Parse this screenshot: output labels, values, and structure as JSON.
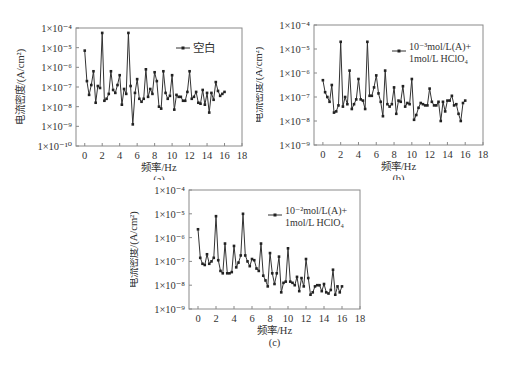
{
  "chart_data": [
    {
      "id": "a",
      "type": "line",
      "caption": "(a)",
      "xlabel": "频率/Hz",
      "ylabel": "电流密度/(A/cm²)",
      "yscale": "log",
      "ylim_exp": [
        -10,
        -4
      ],
      "xlim": [
        -1,
        18
      ],
      "xticks": [
        0,
        2,
        4,
        6,
        8,
        10,
        12,
        14,
        16,
        18
      ],
      "yticks": [
        "1×10⁻¹⁰",
        "1×10⁻⁹",
        "1×10⁻⁸",
        "1×10⁻⁷",
        "1×10⁻⁶",
        "1×10⁻⁵",
        "1×10⁻⁴"
      ],
      "legend": [
        "空白"
      ],
      "legend_position": "upper right",
      "grid": false,
      "series": [
        {
          "name": "空白",
          "x": [
            0,
            0.25,
            0.5,
            0.75,
            1,
            1.25,
            1.5,
            1.75,
            2,
            2.25,
            2.5,
            2.75,
            3,
            3.25,
            3.5,
            3.75,
            4,
            4.25,
            4.5,
            4.75,
            5,
            5.25,
            5.5,
            5.75,
            6,
            6.25,
            6.5,
            6.75,
            7,
            7.25,
            7.5,
            7.75,
            8,
            8.25,
            8.5,
            8.75,
            9,
            9.25,
            9.5,
            9.75,
            10,
            10.25,
            10.5,
            10.75,
            11,
            11.25,
            11.5,
            11.75,
            12,
            12.25,
            12.5,
            12.75,
            13,
            13.25,
            13.5,
            13.75,
            14,
            14.25,
            14.5,
            14.75,
            15,
            15.25,
            15.5,
            15.75,
            16
          ],
          "log10_y": [
            -5.15,
            -6.7,
            -7.4,
            -6.9,
            -6.2,
            -7.8,
            -6.95,
            -7.05,
            -4.25,
            -7.7,
            -7.6,
            -7.35,
            -6.2,
            -7.15,
            -7.3,
            -6.9,
            -6.4,
            -7.9,
            -7.1,
            -7.35,
            -4.25,
            -6.95,
            -8.9,
            -7.3,
            -6.6,
            -7.6,
            -7.75,
            -7.6,
            -6.1,
            -7.5,
            -7.1,
            -7.35,
            -6.25,
            -6.7,
            -8.0,
            -8.1,
            -6.2,
            -7.3,
            -7.6,
            -7.45,
            -6.4,
            -8.15,
            -7.4,
            -7.5,
            -7.5,
            -7.7,
            -7.7,
            -7.25,
            -6.2,
            -7.6,
            -7.5,
            -7.25,
            -7.8,
            -7.85,
            -7.15,
            -7.9,
            -7.3,
            -8.3,
            -7.3,
            -7.65,
            -6.75,
            -7.2,
            -7.45,
            -7.35,
            -7.25
          ]
        }
      ]
    },
    {
      "id": "b",
      "type": "line",
      "caption": "(b)",
      "xlabel": "频率/Hz",
      "ylabel": "电流密度/(A/cm²)",
      "yscale": "log",
      "ylim_exp": [
        -9,
        -4
      ],
      "xlim": [
        -1,
        18
      ],
      "xticks": [
        0,
        2,
        4,
        6,
        8,
        10,
        12,
        14,
        16,
        18
      ],
      "yticks": [
        "1×10⁻⁹",
        "1×10⁻⁸",
        "1×10⁻⁷",
        "1×10⁻⁶",
        "1×10⁻⁵",
        "1×10⁻⁴"
      ],
      "legend": [
        "10⁻³mol/L(A)+",
        "1mol/L HClO₄"
      ],
      "legend_position": "upper right",
      "grid": false,
      "series": [
        {
          "name": "10⁻³mol/L(A)+1mol/L HClO₄",
          "x": [
            0,
            0.25,
            0.5,
            0.75,
            1,
            1.25,
            1.5,
            1.75,
            2,
            2.25,
            2.5,
            2.75,
            3,
            3.25,
            3.5,
            3.75,
            4,
            4.25,
            4.5,
            4.75,
            5,
            5.25,
            5.5,
            5.75,
            6,
            6.25,
            6.5,
            6.75,
            7,
            7.25,
            7.5,
            7.75,
            8,
            8.25,
            8.5,
            8.75,
            9,
            9.25,
            9.5,
            9.75,
            10,
            10.25,
            10.5,
            10.75,
            11,
            11.25,
            11.5,
            11.75,
            12,
            12.25,
            12.5,
            12.75,
            13,
            13.25,
            13.5,
            13.75,
            14,
            14.25,
            14.5,
            14.75,
            15,
            15.25,
            15.5,
            15.75,
            16
          ],
          "log10_y": [
            -6.3,
            -6.8,
            -7.0,
            -7.2,
            -6.5,
            -7.65,
            -7.6,
            -7.35,
            -4.7,
            -7.4,
            -7.0,
            -7.3,
            -5.9,
            -7.5,
            -7.3,
            -7.1,
            -6.25,
            -7.1,
            -7.15,
            -7.5,
            -4.7,
            -6.95,
            -6.95,
            -6.6,
            -6.1,
            -6.85,
            -7.2,
            -7.8,
            -5.9,
            -7.3,
            -7.4,
            -7.3,
            -6.6,
            -7.7,
            -7.15,
            -7.2,
            -6.55,
            -7.4,
            -7.25,
            -7.3,
            -6.25,
            -7.95,
            -7.75,
            -7.45,
            -7.25,
            -7.3,
            -7.35,
            -7.35,
            -6.65,
            -7.2,
            -7.35,
            -7.35,
            -7.2,
            -8.0,
            -7.2,
            -7.6,
            -7.15,
            -7.15,
            -6.95,
            -7.35,
            -7.3,
            -7.7,
            -8.0,
            -7.25,
            -7.15
          ]
        }
      ]
    },
    {
      "id": "c",
      "type": "line",
      "caption": "(c)",
      "xlabel": "频率/Hz",
      "ylabel": "电流密度/(A/cm²)",
      "yscale": "log",
      "ylim_exp": [
        -9,
        -4
      ],
      "xlim": [
        -1,
        18
      ],
      "xticks": [
        0,
        2,
        4,
        6,
        8,
        10,
        12,
        14,
        16,
        18
      ],
      "yticks": [
        "1×10⁻⁹",
        "1×10⁻⁸",
        "1×10⁻⁷",
        "1×10⁻⁶",
        "1×10⁻⁵",
        "1×10⁻⁴"
      ],
      "legend": [
        "10⁻²mol/L(A)+",
        "1mol/L HClO₄"
      ],
      "legend_position": "upper right",
      "grid": false,
      "series": [
        {
          "name": "10⁻²mol/L(A)+1mol/L HClO₄",
          "x": [
            0,
            0.25,
            0.5,
            0.75,
            1,
            1.25,
            1.5,
            1.75,
            2,
            2.25,
            2.5,
            2.75,
            3,
            3.25,
            3.5,
            3.75,
            4,
            4.25,
            4.5,
            4.75,
            5,
            5.25,
            5.5,
            5.75,
            6,
            6.25,
            6.5,
            6.75,
            7,
            7.25,
            7.5,
            7.75,
            8,
            8.25,
            8.5,
            8.75,
            9,
            9.25,
            9.5,
            9.75,
            10,
            10.25,
            10.5,
            10.75,
            11,
            11.25,
            11.5,
            11.75,
            12,
            12.25,
            12.5,
            12.75,
            13,
            13.25,
            13.5,
            13.75,
            14,
            14.25,
            14.5,
            14.75,
            15,
            15.25,
            15.5,
            15.75,
            16
          ],
          "log10_y": [
            -5.65,
            -6.85,
            -7.1,
            -7.15,
            -6.7,
            -7.1,
            -7.0,
            -6.85,
            -5.1,
            -6.95,
            -7.4,
            -7.5,
            -6.25,
            -7.5,
            -7.5,
            -7.45,
            -6.35,
            -7.25,
            -7.05,
            -6.75,
            -5.0,
            -6.75,
            -7.0,
            -7.2,
            -6.9,
            -6.95,
            -7.3,
            -7.4,
            -6.25,
            -7.6,
            -7.8,
            -8.05,
            -6.65,
            -7.5,
            -7.95,
            -7.5,
            -6.8,
            -8.3,
            -7.9,
            -7.85,
            -6.45,
            -7.85,
            -7.9,
            -8.0,
            -7.65,
            -8.25,
            -7.7,
            -8.05,
            -6.9,
            -7.7,
            -8.4,
            -8.3,
            -8.05,
            -8.0,
            -8.0,
            -8.25,
            -7.95,
            -8.3,
            -8.35,
            -8.2,
            -7.35,
            -8.4,
            -8.05,
            -8.3,
            -8.05
          ]
        }
      ]
    }
  ]
}
